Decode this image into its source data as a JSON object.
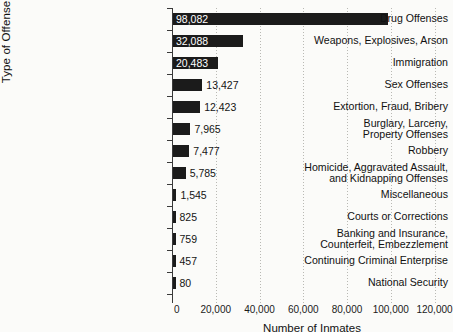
{
  "chart_data": {
    "type": "bar",
    "orientation": "horizontal",
    "title": "",
    "xlabel": "Number of Inmates",
    "ylabel": "Type of Offense",
    "xlim": [
      0,
      128000
    ],
    "xticks": [
      0,
      20000,
      40000,
      60000,
      80000,
      100000,
      120000
    ],
    "xtick_labels": [
      "0",
      "20,000",
      "40,000",
      "60,000",
      "80,000",
      "100,000",
      "120,000"
    ],
    "grid": "vertical-dotted",
    "legend": "none",
    "bar_color": "#1b1b1b",
    "categories": [
      "Drug Offenses",
      "Weapons, Explosives, Arson",
      "Immigration",
      "Sex Offenses",
      "Extortion, Fraud, Bribery",
      "Burglary, Larceny, Property Offenses",
      "Robbery",
      "Homicide, Aggravated Assault, and Kidnapping Offenses",
      "Miscellaneous",
      "Courts or Corrections",
      "Banking and Insurance, Counterfeit, Embezzlement",
      "Continuing Criminal Enterprise",
      "National Security"
    ],
    "values": [
      98082,
      32088,
      20483,
      13427,
      12423,
      7965,
      7477,
      5785,
      1545,
      825,
      759,
      457,
      80
    ],
    "value_labels": [
      "98,082",
      "32,088",
      "20,483",
      "13,427",
      "12,423",
      "7,965",
      "7,477",
      "5,785",
      "1,545",
      "825",
      "759",
      "457",
      "80"
    ],
    "label_lines": [
      [
        "Drug Offenses"
      ],
      [
        "Weapons, Explosives, Arson"
      ],
      [
        "Immigration"
      ],
      [
        "Sex Offenses"
      ],
      [
        "Extortion, Fraud, Bribery"
      ],
      [
        "Burglary, Larceny,",
        "Property Offenses"
      ],
      [
        "Robbery"
      ],
      [
        "Homicide, Aggravated Assault,",
        "and Kidnapping Offenses"
      ],
      [
        "Miscellaneous"
      ],
      [
        "Courts or Corrections"
      ],
      [
        "Banking and Insurance,",
        "Counterfeit, Embezzlement"
      ],
      [
        "Continuing Criminal Enterprise"
      ],
      [
        "National Security"
      ]
    ],
    "value_label_inside": [
      true,
      true,
      true,
      false,
      false,
      false,
      false,
      false,
      false,
      false,
      false,
      false,
      false
    ]
  }
}
